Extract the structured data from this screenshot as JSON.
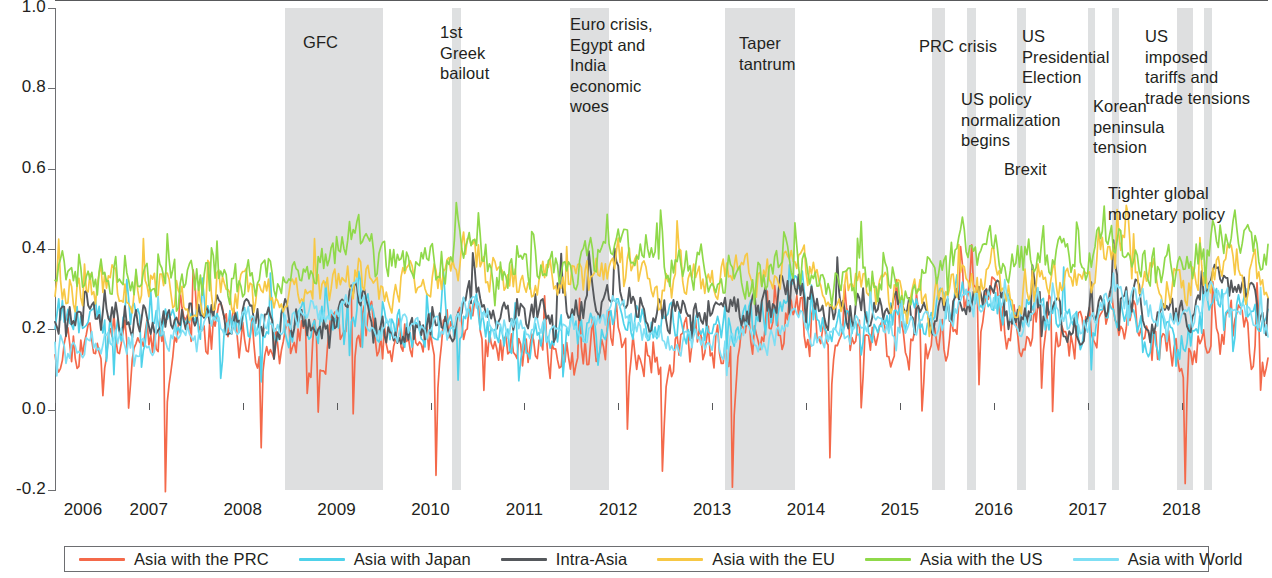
{
  "chart_data": {
    "type": "line",
    "title": "",
    "xlabel": "",
    "ylabel": "",
    "xlim": [
      2006.0,
      2018.92
    ],
    "ylim": [
      -0.2,
      1.0
    ],
    "grid": false,
    "legend_position": "bottom",
    "y_ticks": [
      "1.0",
      "0.8",
      "0.6",
      "0.4",
      "0.2",
      "0.0",
      "-0.2"
    ],
    "y_tick_values": [
      1.0,
      0.8,
      0.6,
      0.4,
      0.2,
      0.0,
      -0.2
    ],
    "x_ticks": [
      "2006",
      "2007",
      "2008",
      "2009",
      "2010",
      "2011",
      "2012",
      "2013",
      "2014",
      "2015",
      "2016",
      "2017",
      "2018"
    ],
    "x_tick_values": [
      2006,
      2007,
      2008,
      2009,
      2010,
      2011,
      2012,
      2013,
      2014,
      2015,
      2016,
      2017,
      2018
    ],
    "series": [
      {
        "name": "Asia with the PRC",
        "color": "#f4694a",
        "mean": 0.165,
        "noise": 0.055,
        "spike_down": 0.26,
        "seed": 11
      },
      {
        "name": "Asia with Japan",
        "color": "#4fd2ea",
        "mean": 0.205,
        "noise": 0.042,
        "spike_down": 0.1,
        "seed": 27
      },
      {
        "name": "Intra-Asia",
        "color": "#55585c",
        "mean": 0.232,
        "noise": 0.038,
        "spike_down": 0.06,
        "seed": 41
      },
      {
        "name": "Asia with the EU",
        "color": "#f7c845",
        "mean": 0.305,
        "noise": 0.046,
        "spike_down": 0.07,
        "seed": 58
      },
      {
        "name": "Asia with the US",
        "color": "#8fd94a",
        "mean": 0.345,
        "noise": 0.046,
        "spike_down": 0.05,
        "seed": 73
      },
      {
        "name": "Asia with World",
        "color": "#7fdff4",
        "mean": 0.196,
        "noise": 0.028,
        "spike_down": 0.05,
        "seed": 94
      }
    ]
  },
  "legend": {
    "items": [
      {
        "label": "Asia with the PRC",
        "color": "#f4694a"
      },
      {
        "label": "Asia with Japan",
        "color": "#4fd2ea"
      },
      {
        "label": "Intra-Asia",
        "color": "#55585c"
      },
      {
        "label": "Asia with the EU",
        "color": "#f7c845"
      },
      {
        "label": "Asia with the US",
        "color": "#8fd94a"
      },
      {
        "label": "Asia with World",
        "color": "#7fdff4"
      }
    ]
  },
  "events": [
    {
      "label": "GFC",
      "band_start": 2008.72,
      "band_end": 2009.65,
      "text_x": 303,
      "text_y": 32,
      "align": "left"
    },
    {
      "label": "1st\nGreek\nbailout",
      "band_start": 2010.36,
      "band_end": 2010.46,
      "text_x": 440,
      "text_y": 22,
      "align": "left"
    },
    {
      "label": "Euro crisis,\nEgypt and\nIndia\neconomic\nwoes",
      "band_start": 2011.77,
      "band_end": 2012.18,
      "text_x": 570,
      "text_y": 14,
      "align": "left"
    },
    {
      "label": "Taper\ntantrum",
      "band_start": 2013.5,
      "band_end": 2014.18,
      "text_x": 739,
      "text_y": 33,
      "align": "left"
    },
    {
      "label": "PRC crisis",
      "band_start": 2015.6,
      "band_end": 2015.76,
      "text_x": 919,
      "text_y": 36,
      "align": "left"
    },
    {
      "label": "US policy\nnormalization\nbegins",
      "band_start": 2015.94,
      "band_end": 2016.01,
      "text_x": 961,
      "text_y": 89,
      "align": "left"
    },
    {
      "label": "US\nPresidential\nElection",
      "band_start": 2016.46,
      "band_end": 2016.52,
      "text_x": 1022,
      "text_y": 26,
      "align": "left"
    },
    {
      "label": "Brexit",
      "band_start": 2017.17,
      "band_end": 2017.23,
      "text_x": 1004,
      "text_y": 159,
      "align": "left"
    },
    {
      "label": "Korean\npeninsula\ntension",
      "band_start": 2017.42,
      "band_end": 2017.48,
      "text_x": 1093,
      "text_y": 96,
      "align": "left"
    },
    {
      "label": "Tighter global\nmonetary policy",
      "band_start": 2018.17,
      "band_end": 2018.48,
      "text_x": 1108,
      "text_y": 183,
      "align": "left"
    },
    {
      "label": "US\nimposed\ntariffs and\ntrade tensions",
      "band_start": 2018.56,
      "band_end": 2018.64,
      "text_x": 1145,
      "text_y": 26,
      "align": "left"
    }
  ],
  "bands": [
    {
      "name": "gfc-band",
      "x": 285,
      "width": 98,
      "thin": false
    },
    {
      "name": "greek-bailout-band",
      "x": 452,
      "width": 9,
      "thin": true
    },
    {
      "name": "euro-crisis-band",
      "x": 570,
      "width": 39,
      "thin": false
    },
    {
      "name": "taper-tantrum-band",
      "x": 725,
      "width": 70,
      "thin": false
    },
    {
      "name": "prc-crisis-band",
      "x": 932,
      "width": 13,
      "thin": false
    },
    {
      "name": "us-policy-band",
      "x": 967,
      "width": 9,
      "thin": true
    },
    {
      "name": "us-election-band",
      "x": 1017,
      "width": 9,
      "thin": true
    },
    {
      "name": "brexit-band",
      "x": 1088,
      "width": 7,
      "thin": true
    },
    {
      "name": "korean-tension-band",
      "x": 1112,
      "width": 7,
      "thin": true
    },
    {
      "name": "us-tariffs-band",
      "x": 1177,
      "width": 16,
      "thin": false
    },
    {
      "name": "tighter-policy-band",
      "x": 1204,
      "width": 8,
      "thin": true
    }
  ]
}
